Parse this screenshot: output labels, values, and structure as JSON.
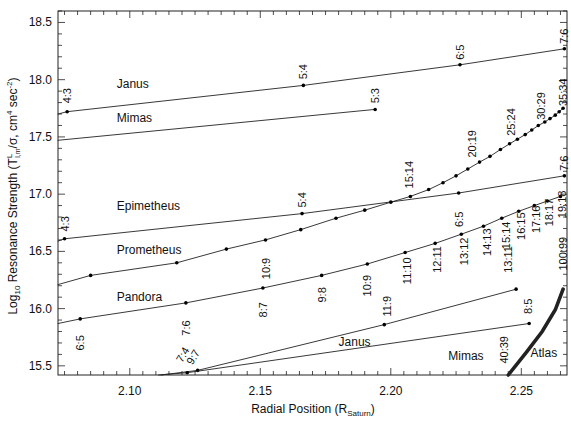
{
  "chart_data": {
    "type": "line",
    "title": "",
    "xlabel": "Radial Position (R_Saturn)",
    "xlabel_main": "Radial Position (R",
    "xlabel_sub": "Saturn",
    "xlabel_end": ")",
    "ylabel": "Log10 Resonance Strength (T^L_l,m/σ, cm^4 sec^-2)",
    "xlim": [
      2.0725,
      2.2675
    ],
    "ylim": [
      15.42,
      18.6
    ],
    "x_ticks": [
      2.1,
      2.15,
      2.2,
      2.25
    ],
    "x_tick_labels": [
      "2.10",
      "2.15",
      "2.20",
      "2.25"
    ],
    "y_ticks": [
      15.5,
      16.0,
      16.5,
      17.0,
      17.5,
      18.0,
      18.5
    ],
    "y_tick_labels": [
      "15.5",
      "16.0",
      "16.5",
      "17.0",
      "17.5",
      "18.0",
      "18.5"
    ],
    "grid": false,
    "legend": "inline labels",
    "series": [
      {
        "name": "Janus",
        "group": "first-order",
        "label_pos": [
          2.095,
          17.93
        ],
        "points": [
          {
            "x": 2.0725,
            "y": 17.7,
            "label": ""
          },
          {
            "x": 2.076,
            "y": 17.72,
            "label": "4:3"
          },
          {
            "x": 2.1665,
            "y": 17.95,
            "label": "5:4"
          },
          {
            "x": 2.2265,
            "y": 18.13,
            "label": "6:5"
          },
          {
            "x": 2.2665,
            "y": 18.27,
            "label": "7:6"
          }
        ]
      },
      {
        "name": "Mimas",
        "group": "first-order",
        "label_pos": [
          2.095,
          17.63
        ],
        "points": [
          {
            "x": 2.0725,
            "y": 17.47,
            "label": ""
          },
          {
            "x": 2.194,
            "y": 17.74,
            "label": "5:3"
          }
        ]
      },
      {
        "name": "Epimetheus",
        "group": "first-order",
        "label_pos": [
          2.095,
          16.86
        ],
        "points": [
          {
            "x": 2.0725,
            "y": 16.59,
            "label": ""
          },
          {
            "x": 2.075,
            "y": 16.61,
            "label": "4:3"
          },
          {
            "x": 2.166,
            "y": 16.83,
            "label": "5:4"
          },
          {
            "x": 2.226,
            "y": 17.01,
            "label": "6:5"
          },
          {
            "x": 2.2665,
            "y": 17.16,
            "label": "7:6"
          }
        ]
      },
      {
        "name": "Prometheus",
        "group": "first-order",
        "label_pos": [
          2.095,
          16.48
        ],
        "points": [
          {
            "x": 2.0725,
            "y": 16.21,
            "label": ""
          },
          {
            "x": 2.085,
            "y": 16.29,
            "label": ""
          },
          {
            "x": 2.118,
            "y": 16.4,
            "label": ""
          },
          {
            "x": 2.137,
            "y": 16.52,
            "label": ""
          },
          {
            "x": 2.152,
            "y": 16.6,
            "label": "10:9"
          },
          {
            "x": 2.1655,
            "y": 16.69,
            "label": ""
          },
          {
            "x": 2.179,
            "y": 16.79,
            "label": ""
          },
          {
            "x": 2.19,
            "y": 16.86,
            "label": ""
          },
          {
            "x": 2.2,
            "y": 16.93,
            "label": ""
          },
          {
            "x": 2.2075,
            "y": 16.98,
            "label": "15:14"
          },
          {
            "x": 2.2145,
            "y": 17.04,
            "label": ""
          },
          {
            "x": 2.22,
            "y": 17.1,
            "label": ""
          },
          {
            "x": 2.225,
            "y": 17.16,
            "label": ""
          },
          {
            "x": 2.2295,
            "y": 17.22,
            "label": ""
          },
          {
            "x": 2.234,
            "y": 17.28,
            "label": "20:19"
          },
          {
            "x": 2.238,
            "y": 17.33,
            "label": ""
          },
          {
            "x": 2.242,
            "y": 17.39,
            "label": ""
          },
          {
            "x": 2.2455,
            "y": 17.44,
            "label": ""
          },
          {
            "x": 2.2485,
            "y": 17.48,
            "label": "25:24"
          },
          {
            "x": 2.2515,
            "y": 17.52,
            "label": ""
          },
          {
            "x": 2.254,
            "y": 17.56,
            "label": ""
          },
          {
            "x": 2.2565,
            "y": 17.6,
            "label": ""
          },
          {
            "x": 2.259,
            "y": 17.63,
            "label": "30:29"
          },
          {
            "x": 2.261,
            "y": 17.66,
            "label": ""
          },
          {
            "x": 2.263,
            "y": 17.69,
            "label": ""
          },
          {
            "x": 2.2645,
            "y": 17.72,
            "label": ""
          },
          {
            "x": 2.266,
            "y": 17.75,
            "label": "35:34"
          }
        ]
      },
      {
        "name": "Pandora",
        "group": "first-order",
        "label_pos": [
          2.095,
          16.07
        ],
        "points": [
          {
            "x": 2.0725,
            "y": 15.87,
            "label": ""
          },
          {
            "x": 2.081,
            "y": 15.91,
            "label": "6:5"
          },
          {
            "x": 2.1215,
            "y": 16.05,
            "label": "7:6"
          },
          {
            "x": 2.151,
            "y": 16.18,
            "label": "8:7"
          },
          {
            "x": 2.1735,
            "y": 16.29,
            "label": "9:8"
          },
          {
            "x": 2.191,
            "y": 16.39,
            "label": "10:9"
          },
          {
            "x": 2.2055,
            "y": 16.49,
            "label": "11:10"
          },
          {
            "x": 2.217,
            "y": 16.57,
            "label": "12:11"
          },
          {
            "x": 2.227,
            "y": 16.65,
            "label": "13:12"
          },
          {
            "x": 2.2355,
            "y": 16.72,
            "label": "14:13"
          },
          {
            "x": 2.2425,
            "y": 16.79,
            "label": "15:14"
          },
          {
            "x": 2.249,
            "y": 16.85,
            "label": "16:15"
          },
          {
            "x": 2.255,
            "y": 16.9,
            "label": "17:16"
          },
          {
            "x": 2.26,
            "y": 16.94,
            "label": "18:17"
          },
          {
            "x": 2.265,
            "y": 16.98,
            "label": "19:18"
          }
        ]
      },
      {
        "name": "Janus",
        "group": "second-order",
        "label_pos": [
          2.18,
          15.67
        ],
        "points": [
          {
            "x": 2.112,
            "y": 15.42,
            "label": ""
          },
          {
            "x": 2.126,
            "y": 15.46,
            "label": "9:7"
          },
          {
            "x": 2.1975,
            "y": 15.86,
            "label": "11:9"
          },
          {
            "x": 2.248,
            "y": 16.17,
            "label": "13:11"
          }
        ]
      },
      {
        "name": "Mimas",
        "group": "second-order",
        "label_pos": [
          2.222,
          15.55
        ],
        "points": [
          {
            "x": 2.111,
            "y": 15.42,
            "label": ""
          },
          {
            "x": 2.122,
            "y": 15.44,
            "label": "7:4"
          },
          {
            "x": 2.253,
            "y": 15.87,
            "label": "8:5"
          }
        ]
      },
      {
        "name": "Atlas",
        "group": "high-order",
        "label_pos": [
          2.2535,
          15.58
        ],
        "thick": true,
        "points": [
          {
            "x": 2.245,
            "y": 15.42,
            "label": "40:39"
          },
          {
            "x": 2.252,
            "y": 15.62,
            "label": ""
          },
          {
            "x": 2.258,
            "y": 15.8,
            "label": ""
          },
          {
            "x": 2.263,
            "y": 15.99,
            "label": ""
          },
          {
            "x": 2.266,
            "y": 16.17,
            "label": "100:99"
          }
        ]
      }
    ],
    "annotations": [
      {
        "text": "4:3",
        "x": 2.076,
        "y": 17.86,
        "rotate": -90
      },
      {
        "text": "5:4",
        "x": 2.1665,
        "y": 18.07,
        "rotate": -90
      },
      {
        "text": "6:5",
        "x": 2.2265,
        "y": 18.24,
        "rotate": -90
      },
      {
        "text": "7:6",
        "x": 2.2665,
        "y": 18.38,
        "rotate": -90
      },
      {
        "text": "5:3",
        "x": 2.194,
        "y": 17.86,
        "rotate": -90
      },
      {
        "text": "4:3",
        "x": 2.075,
        "y": 16.74,
        "rotate": -90
      },
      {
        "text": "5:4",
        "x": 2.166,
        "y": 16.95,
        "rotate": -90
      },
      {
        "text": "6:5",
        "x": 2.226,
        "y": 16.78,
        "rotate": -90
      },
      {
        "text": "7:6",
        "x": 2.2665,
        "y": 17.27,
        "rotate": -90
      },
      {
        "text": "10:9",
        "x": 2.152,
        "y": 16.35,
        "rotate": -90
      },
      {
        "text": "15:14",
        "x": 2.207,
        "y": 17.17,
        "rotate": -90
      },
      {
        "text": "20:19",
        "x": 2.231,
        "y": 17.44,
        "rotate": -90
      },
      {
        "text": "25:24",
        "x": 2.246,
        "y": 17.63,
        "rotate": -90
      },
      {
        "text": "30:29",
        "x": 2.2575,
        "y": 17.77,
        "rotate": -90
      },
      {
        "text": "35:34",
        "x": 2.266,
        "y": 17.89,
        "rotate": -90
      },
      {
        "text": "6:5",
        "x": 2.081,
        "y": 15.7,
        "rotate": -90
      },
      {
        "text": "7:6",
        "x": 2.1215,
        "y": 15.83,
        "rotate": -90
      },
      {
        "text": "8:7",
        "x": 2.151,
        "y": 15.99,
        "rotate": -90
      },
      {
        "text": "9:8",
        "x": 2.1735,
        "y": 16.12,
        "rotate": -90
      },
      {
        "text": "10:9",
        "x": 2.191,
        "y": 16.2,
        "rotate": -90
      },
      {
        "text": "11:10",
        "x": 2.206,
        "y": 16.33,
        "rotate": -90
      },
      {
        "text": "12:11",
        "x": 2.2175,
        "y": 16.43,
        "rotate": -90
      },
      {
        "text": "13:12",
        "x": 2.228,
        "y": 16.5,
        "rotate": -90
      },
      {
        "text": "14:13",
        "x": 2.237,
        "y": 16.58,
        "rotate": -90
      },
      {
        "text": "15:14",
        "x": 2.244,
        "y": 16.64,
        "rotate": -90
      },
      {
        "text": "16:15",
        "x": 2.25,
        "y": 16.72,
        "rotate": -90
      },
      {
        "text": "17:16",
        "x": 2.2555,
        "y": 16.78,
        "rotate": -90
      },
      {
        "text": "18:17",
        "x": 2.2605,
        "y": 16.84,
        "rotate": -90
      },
      {
        "text": "19:18",
        "x": 2.2655,
        "y": 16.91,
        "rotate": -90
      },
      {
        "text": "11:9",
        "x": 2.1985,
        "y": 16.02,
        "rotate": -90
      },
      {
        "text": "13:11",
        "x": 2.245,
        "y": 16.43,
        "rotate": -90
      },
      {
        "text": "8:5",
        "x": 2.2525,
        "y": 16.02,
        "rotate": -90
      },
      {
        "text": "7:4",
        "x": 2.12,
        "y": 15.58,
        "rotate": -60
      },
      {
        "text": "9:7",
        "x": 2.124,
        "y": 15.56,
        "rotate": -60
      },
      {
        "text": "40:39",
        "x": 2.2435,
        "y": 15.64,
        "rotate": -90
      },
      {
        "text": "100:99",
        "x": 2.266,
        "y": 16.48,
        "rotate": -90
      }
    ]
  }
}
